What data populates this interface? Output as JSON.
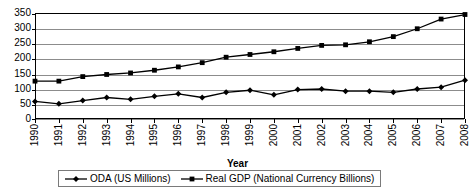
{
  "chart_data": {
    "type": "line",
    "title": "",
    "xlabel": "Year",
    "ylabel": "",
    "grid": true,
    "legend_position": "bottom",
    "ylim": [
      0,
      350
    ],
    "yticks": [
      0,
      50,
      100,
      150,
      200,
      250,
      300,
      350
    ],
    "categories": [
      "1990",
      "1991",
      "1992",
      "1993",
      "1994",
      "1995",
      "1996",
      "1997",
      "1998",
      "1999",
      "2000",
      "2001",
      "2002",
      "2003",
      "2004",
      "2005",
      "2006",
      "2007",
      "2008"
    ],
    "series": [
      {
        "name": "ODA (US Millions)",
        "marker": "diamond",
        "color": "#000000",
        "values": [
          58,
          50,
          61,
          71,
          65,
          75,
          83,
          71,
          88,
          95,
          80,
          97,
          99,
          92,
          92,
          88,
          99,
          105,
          128
        ]
      },
      {
        "name": "Real GDP (National Currency Billions)",
        "marker": "square",
        "color": "#000000",
        "values": [
          125,
          125,
          140,
          147,
          152,
          161,
          172,
          186,
          204,
          213,
          222,
          233,
          243,
          245,
          255,
          272,
          298,
          330,
          345
        ]
      }
    ]
  },
  "axis": {
    "x_title": "Year"
  },
  "legend": {
    "items": [
      {
        "label": "ODA (US Millions)",
        "marker": "diamond"
      },
      {
        "label": "Real GDP (National Currency Billions)",
        "marker": "square"
      }
    ]
  }
}
